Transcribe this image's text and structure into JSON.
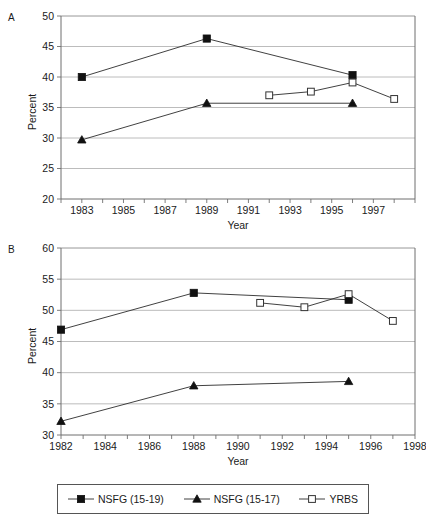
{
  "figure": {
    "panels": [
      {
        "letter": "A",
        "name": "panel-a"
      },
      {
        "letter": "B",
        "name": "panel-b"
      }
    ],
    "legend": {
      "items": [
        {
          "label": "NSFG (15-19)",
          "marker": "filled-square",
          "color": "#111111"
        },
        {
          "label": "NSFG (15-17)",
          "marker": "filled-triangle",
          "color": "#111111"
        },
        {
          "label": "YRBS",
          "marker": "open-square",
          "color": "#333333"
        }
      ]
    }
  },
  "chart_data": [
    {
      "type": "line",
      "name": "panel-a",
      "title": "A",
      "xlabel": "Year",
      "ylabel": "Percent",
      "xlim": [
        1982,
        1999
      ],
      "ylim": [
        20,
        50
      ],
      "yticks": [
        20,
        25,
        30,
        35,
        40,
        45,
        50
      ],
      "ytick_labels": [
        "20",
        "25",
        "30",
        "35",
        "40",
        "45",
        "50"
      ],
      "xticks": [
        1982,
        1983,
        1984,
        1985,
        1986,
        1987,
        1988,
        1989,
        1990,
        1991,
        1992,
        1993,
        1994,
        1995,
        1996,
        1997,
        1998,
        1999
      ],
      "xtick_labels": [
        "",
        "1983",
        "",
        "1985",
        "",
        "1987",
        "",
        "1989",
        "",
        "1991",
        "",
        "1993",
        "",
        "1995",
        "",
        "1997",
        "",
        ""
      ],
      "grid": "horizontal",
      "legend_position": "below-figure",
      "series": [
        {
          "name": "NSFG (15-19)",
          "marker": "filled-square",
          "x": [
            1983,
            1989,
            1996
          ],
          "values": [
            40.0,
            46.3,
            40.3
          ]
        },
        {
          "name": "NSFG (15-17)",
          "marker": "filled-triangle",
          "x": [
            1983,
            1989,
            1996
          ],
          "values": [
            29.7,
            35.7,
            35.7
          ]
        },
        {
          "name": "YRBS",
          "marker": "open-square",
          "x": [
            1992,
            1994,
            1996,
            1998
          ],
          "values": [
            37.0,
            37.6,
            39.1,
            36.4
          ]
        }
      ]
    },
    {
      "type": "line",
      "name": "panel-b",
      "title": "B",
      "xlabel": "Year",
      "ylabel": "Percent",
      "xlim": [
        1982,
        1998
      ],
      "ylim": [
        30,
        60
      ],
      "yticks": [
        30,
        35,
        40,
        45,
        50,
        55,
        60
      ],
      "ytick_labels": [
        "30",
        "35",
        "40",
        "45",
        "50",
        "55",
        "60"
      ],
      "xticks": [
        1982,
        1983,
        1984,
        1985,
        1986,
        1987,
        1988,
        1989,
        1990,
        1991,
        1992,
        1993,
        1994,
        1995,
        1996,
        1997,
        1998
      ],
      "xtick_labels": [
        "1982",
        "",
        "1984",
        "",
        "1986",
        "",
        "1988",
        "",
        "1990",
        "",
        "1992",
        "",
        "1994",
        "",
        "1996",
        "",
        "1998"
      ],
      "grid": "horizontal",
      "legend_position": "below-figure",
      "series": [
        {
          "name": "NSFG (15-19)",
          "marker": "filled-square",
          "x": [
            1982,
            1988,
            1995
          ],
          "values": [
            46.9,
            52.8,
            51.7
          ]
        },
        {
          "name": "NSFG (15-17)",
          "marker": "filled-triangle",
          "x": [
            1982,
            1988,
            1995
          ],
          "values": [
            32.2,
            37.9,
            38.6
          ]
        },
        {
          "name": "YRBS",
          "marker": "open-square",
          "x": [
            1991,
            1993,
            1995,
            1997
          ],
          "values": [
            51.2,
            50.5,
            52.6,
            48.3
          ]
        }
      ]
    }
  ]
}
